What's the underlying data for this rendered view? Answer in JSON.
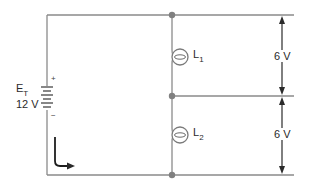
{
  "diagram": {
    "type": "series circuit",
    "colors": {
      "wire": "#8a8a8a",
      "junction": "#808080",
      "dimension": "#2a2a2a",
      "text": "#2a2a2a"
    },
    "source": {
      "label_main": "E",
      "label_sub": "T",
      "voltage": "12 V",
      "positive_sign": "+",
      "negative_sign": "−"
    },
    "loads": [
      {
        "label_main": "L",
        "label_sub": "1"
      },
      {
        "label_main": "L",
        "label_sub": "2"
      }
    ],
    "voltage_drops": [
      {
        "value": "6 V"
      },
      {
        "value": "6 V"
      }
    ],
    "current": {
      "label": "I"
    }
  }
}
